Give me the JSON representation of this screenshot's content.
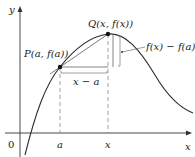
{
  "diagram": {
    "axes": {
      "x_label": "x",
      "y_label": "y",
      "origin_label": "0"
    },
    "points": [
      {
        "id": "P",
        "label": "P(a, f(a))"
      },
      {
        "id": "Q",
        "label": "Q(x, f(x))"
      }
    ],
    "tick_labels": {
      "a": "a",
      "x": "x"
    },
    "annotations": {
      "horizontal_span": "x − a",
      "vertical_span": "f(x) − f(a)"
    },
    "colors": {
      "curve": "#2b2b2b",
      "secant": "#555555",
      "guides": "#888888"
    }
  }
}
